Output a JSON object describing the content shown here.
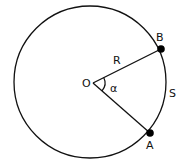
{
  "diagram": {
    "type": "circle-sector",
    "colors": {
      "stroke": "#111111",
      "point": "#000000",
      "background": "#ffffff"
    },
    "circle": {
      "cx": 90,
      "cy": 82,
      "r": 77
    },
    "center": {
      "label": "O",
      "x": 93,
      "y": 83
    },
    "points": [
      {
        "label": "B",
        "x": 161,
        "y": 49
      },
      {
        "label": "A",
        "x": 150,
        "y": 133
      }
    ],
    "labels": {
      "center": "O",
      "radius": "R",
      "angle": "α",
      "arc": "S",
      "pointA": "A",
      "pointB": "B"
    }
  }
}
